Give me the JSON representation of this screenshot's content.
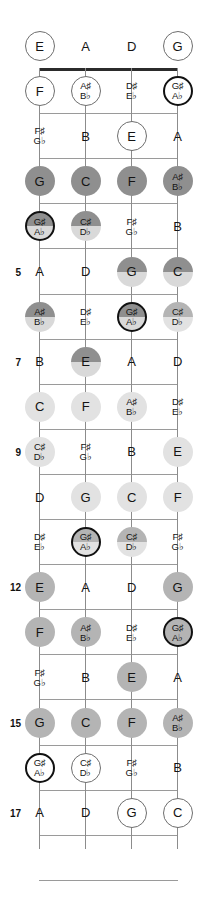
{
  "diagram": {
    "instrument": "4-string bass",
    "open_strings": [
      "E",
      "A",
      "D",
      "G"
    ],
    "fret_count": 17,
    "fret_numbers_shown": [
      5,
      7,
      9,
      12,
      15,
      17
    ],
    "colors": {
      "nut": "#2b2b2b",
      "fret": "#9a9a9a",
      "string": "#8c8c8c",
      "fill_white": "#ffffff",
      "fill_light": "#e2e2e2",
      "fill_medium": "#b4b4b4",
      "fill_dark": "#8f8f8f",
      "outline_thin": "#6e6e6e",
      "outline_thick": "#111111"
    }
  },
  "fret_numbers": [
    {
      "label": "5",
      "fret": 5
    },
    {
      "label": "7",
      "fret": 7
    },
    {
      "label": "9",
      "fret": 9
    },
    {
      "label": "12",
      "fret": 12
    },
    {
      "label": "15",
      "fret": 15
    },
    {
      "label": "17",
      "fret": 17
    }
  ],
  "notes": [
    {
      "fret": 0,
      "string": 1,
      "label": "E",
      "alt": "",
      "shape": "circle-thin",
      "fill": "white"
    },
    {
      "fret": 0,
      "string": 2,
      "label": "A",
      "alt": "",
      "shape": "text",
      "fill": "none"
    },
    {
      "fret": 0,
      "string": 3,
      "label": "D",
      "alt": "",
      "shape": "text",
      "fill": "none"
    },
    {
      "fret": 0,
      "string": 4,
      "label": "G",
      "alt": "",
      "shape": "circle-thin",
      "fill": "white"
    },
    {
      "fret": 1,
      "string": 1,
      "label": "F",
      "alt": "",
      "shape": "circle-thin",
      "fill": "white"
    },
    {
      "fret": 1,
      "string": 2,
      "label": "A♯",
      "alt": "B♭",
      "shape": "circle-thin",
      "fill": "white"
    },
    {
      "fret": 1,
      "string": 3,
      "label": "D♯",
      "alt": "E♭",
      "shape": "text",
      "fill": "none"
    },
    {
      "fret": 1,
      "string": 4,
      "label": "G♯",
      "alt": "A♭",
      "shape": "circle-thick",
      "fill": "white"
    },
    {
      "fret": 2,
      "string": 1,
      "label": "F♯",
      "alt": "G♭",
      "shape": "text",
      "fill": "none"
    },
    {
      "fret": 2,
      "string": 2,
      "label": "B",
      "alt": "",
      "shape": "text",
      "fill": "none"
    },
    {
      "fret": 2,
      "string": 3,
      "label": "E",
      "alt": "",
      "shape": "circle-thin",
      "fill": "white"
    },
    {
      "fret": 2,
      "string": 4,
      "label": "A",
      "alt": "",
      "shape": "text",
      "fill": "none"
    },
    {
      "fret": 3,
      "string": 1,
      "label": "G",
      "alt": "",
      "shape": "circle-plain",
      "fill": "dark"
    },
    {
      "fret": 3,
      "string": 2,
      "label": "C",
      "alt": "",
      "shape": "circle-plain",
      "fill": "dark"
    },
    {
      "fret": 3,
      "string": 3,
      "label": "F",
      "alt": "",
      "shape": "circle-plain",
      "fill": "dark"
    },
    {
      "fret": 3,
      "string": 4,
      "label": "A♯",
      "alt": "B♭",
      "shape": "circle-plain",
      "fill": "dark"
    },
    {
      "fret": 4,
      "string": 1,
      "label": "G♯",
      "alt": "A♭",
      "shape": "circle-thick",
      "fill": "split-dark"
    },
    {
      "fret": 4,
      "string": 2,
      "label": "C♯",
      "alt": "D♭",
      "shape": "circle-plain",
      "fill": "split-dark"
    },
    {
      "fret": 4,
      "string": 3,
      "label": "F♯",
      "alt": "G♭",
      "shape": "text",
      "fill": "none"
    },
    {
      "fret": 4,
      "string": 4,
      "label": "B",
      "alt": "",
      "shape": "text",
      "fill": "none"
    },
    {
      "fret": 5,
      "string": 1,
      "label": "A",
      "alt": "",
      "shape": "text",
      "fill": "none"
    },
    {
      "fret": 5,
      "string": 2,
      "label": "D",
      "alt": "",
      "shape": "text",
      "fill": "none"
    },
    {
      "fret": 5,
      "string": 3,
      "label": "G",
      "alt": "",
      "shape": "circle-plain",
      "fill": "split-dark"
    },
    {
      "fret": 5,
      "string": 4,
      "label": "C",
      "alt": "",
      "shape": "circle-plain",
      "fill": "split-dark"
    },
    {
      "fret": 6,
      "string": 1,
      "label": "A♯",
      "alt": "B♭",
      "shape": "circle-plain",
      "fill": "split-dark"
    },
    {
      "fret": 6,
      "string": 2,
      "label": "D♯",
      "alt": "E♭",
      "shape": "text",
      "fill": "none"
    },
    {
      "fret": 6,
      "string": 3,
      "label": "G♯",
      "alt": "A♭",
      "shape": "circle-thick",
      "fill": "split-dark"
    },
    {
      "fret": 6,
      "string": 4,
      "label": "C♯",
      "alt": "D♭",
      "shape": "circle-plain",
      "fill": "split-med"
    },
    {
      "fret": 7,
      "string": 1,
      "label": "B",
      "alt": "",
      "shape": "text",
      "fill": "none"
    },
    {
      "fret": 7,
      "string": 2,
      "label": "E",
      "alt": "",
      "shape": "circle-plain",
      "fill": "split-dark"
    },
    {
      "fret": 7,
      "string": 3,
      "label": "A",
      "alt": "",
      "shape": "text",
      "fill": "none"
    },
    {
      "fret": 7,
      "string": 4,
      "label": "D",
      "alt": "",
      "shape": "text",
      "fill": "none"
    },
    {
      "fret": 8,
      "string": 1,
      "label": "C",
      "alt": "",
      "shape": "circle-plain",
      "fill": "light"
    },
    {
      "fret": 8,
      "string": 2,
      "label": "F",
      "alt": "",
      "shape": "circle-plain",
      "fill": "light"
    },
    {
      "fret": 8,
      "string": 3,
      "label": "A♯",
      "alt": "B♭",
      "shape": "circle-plain",
      "fill": "light"
    },
    {
      "fret": 8,
      "string": 4,
      "label": "D♯",
      "alt": "E♭",
      "shape": "text",
      "fill": "none"
    },
    {
      "fret": 9,
      "string": 1,
      "label": "C♯",
      "alt": "D♭",
      "shape": "circle-plain",
      "fill": "light"
    },
    {
      "fret": 9,
      "string": 2,
      "label": "F♯",
      "alt": "G♭",
      "shape": "text",
      "fill": "none"
    },
    {
      "fret": 9,
      "string": 3,
      "label": "B",
      "alt": "",
      "shape": "text",
      "fill": "none"
    },
    {
      "fret": 9,
      "string": 4,
      "label": "E",
      "alt": "",
      "shape": "circle-plain",
      "fill": "light"
    },
    {
      "fret": 10,
      "string": 1,
      "label": "D",
      "alt": "",
      "shape": "text",
      "fill": "none"
    },
    {
      "fret": 10,
      "string": 2,
      "label": "G",
      "alt": "",
      "shape": "circle-plain",
      "fill": "light"
    },
    {
      "fret": 10,
      "string": 3,
      "label": "C",
      "alt": "",
      "shape": "circle-plain",
      "fill": "light"
    },
    {
      "fret": 10,
      "string": 4,
      "label": "F",
      "alt": "",
      "shape": "circle-plain",
      "fill": "light"
    },
    {
      "fret": 11,
      "string": 1,
      "label": "D♯",
      "alt": "E♭",
      "shape": "text",
      "fill": "none"
    },
    {
      "fret": 11,
      "string": 2,
      "label": "G♯",
      "alt": "A♭",
      "shape": "circle-thick",
      "fill": "split-med"
    },
    {
      "fret": 11,
      "string": 3,
      "label": "C♯",
      "alt": "D♭",
      "shape": "circle-plain",
      "fill": "split-med"
    },
    {
      "fret": 11,
      "string": 4,
      "label": "F♯",
      "alt": "G♭",
      "shape": "text",
      "fill": "none"
    },
    {
      "fret": 12,
      "string": 1,
      "label": "E",
      "alt": "",
      "shape": "circle-plain",
      "fill": "med"
    },
    {
      "fret": 12,
      "string": 2,
      "label": "A",
      "alt": "",
      "shape": "text",
      "fill": "none"
    },
    {
      "fret": 12,
      "string": 3,
      "label": "D",
      "alt": "",
      "shape": "text",
      "fill": "none"
    },
    {
      "fret": 12,
      "string": 4,
      "label": "G",
      "alt": "",
      "shape": "circle-plain",
      "fill": "med"
    },
    {
      "fret": 13,
      "string": 1,
      "label": "F",
      "alt": "",
      "shape": "circle-plain",
      "fill": "med"
    },
    {
      "fret": 13,
      "string": 2,
      "label": "A♯",
      "alt": "B♭",
      "shape": "circle-plain",
      "fill": "med"
    },
    {
      "fret": 13,
      "string": 3,
      "label": "D♯",
      "alt": "E♭",
      "shape": "text",
      "fill": "none"
    },
    {
      "fret": 13,
      "string": 4,
      "label": "G♯",
      "alt": "A♭",
      "shape": "circle-thick",
      "fill": "med"
    },
    {
      "fret": 14,
      "string": 1,
      "label": "F♯",
      "alt": "G♭",
      "shape": "text",
      "fill": "none"
    },
    {
      "fret": 14,
      "string": 2,
      "label": "B",
      "alt": "",
      "shape": "text",
      "fill": "none"
    },
    {
      "fret": 14,
      "string": 3,
      "label": "E",
      "alt": "",
      "shape": "circle-plain",
      "fill": "med"
    },
    {
      "fret": 14,
      "string": 4,
      "label": "A",
      "alt": "",
      "shape": "text",
      "fill": "none"
    },
    {
      "fret": 15,
      "string": 1,
      "label": "G",
      "alt": "",
      "shape": "circle-plain",
      "fill": "med"
    },
    {
      "fret": 15,
      "string": 2,
      "label": "C",
      "alt": "",
      "shape": "circle-plain",
      "fill": "med"
    },
    {
      "fret": 15,
      "string": 3,
      "label": "F",
      "alt": "",
      "shape": "circle-plain",
      "fill": "med"
    },
    {
      "fret": 15,
      "string": 4,
      "label": "A♯",
      "alt": "B♭",
      "shape": "circle-plain",
      "fill": "med"
    },
    {
      "fret": 16,
      "string": 1,
      "label": "G♯",
      "alt": "A♭",
      "shape": "circle-thick",
      "fill": "white"
    },
    {
      "fret": 16,
      "string": 2,
      "label": "C♯",
      "alt": "D♭",
      "shape": "circle-thin",
      "fill": "white"
    },
    {
      "fret": 16,
      "string": 3,
      "label": "F♯",
      "alt": "G♭",
      "shape": "text",
      "fill": "none"
    },
    {
      "fret": 16,
      "string": 4,
      "label": "B",
      "alt": "",
      "shape": "text",
      "fill": "none"
    },
    {
      "fret": 17,
      "string": 1,
      "label": "A",
      "alt": "",
      "shape": "text",
      "fill": "none"
    },
    {
      "fret": 17,
      "string": 2,
      "label": "D",
      "alt": "",
      "shape": "text",
      "fill": "none"
    },
    {
      "fret": 17,
      "string": 3,
      "label": "G",
      "alt": "",
      "shape": "circle-thin",
      "fill": "white"
    },
    {
      "fret": 17,
      "string": 4,
      "label": "C",
      "alt": "",
      "shape": "circle-thin",
      "fill": "white"
    }
  ]
}
